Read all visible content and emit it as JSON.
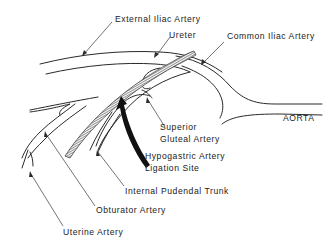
{
  "diagram": {
    "labels": {
      "external_iliac": "External Iliac Artery",
      "ureter": "Ureter",
      "common_iliac": "Common Iliac Artery",
      "aorta": "AORTA",
      "superior_gluteal_line1": "Superior",
      "superior_gluteal_line2": "Gluteal Artery",
      "hypogastric_line1": "Hypogastric Artery",
      "hypogastric_line2": "Ligation Site",
      "internal_pudendal": "Internal Pudendal Trunk",
      "obturator": "Obturator Artery",
      "uterine": "Uterine Artery"
    },
    "colors": {
      "line": "#2a2a2a",
      "text": "#222222",
      "background": "#ffffff"
    }
  }
}
